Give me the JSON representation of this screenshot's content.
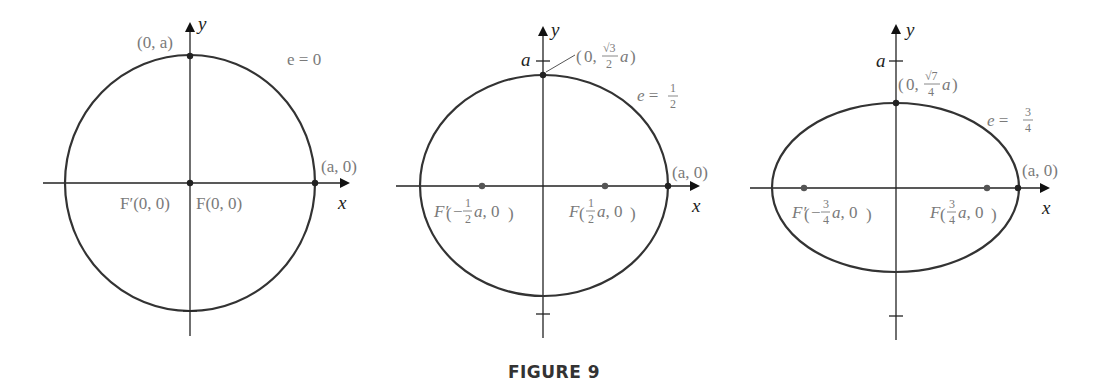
{
  "figure": {
    "caption": "FIGURE 9",
    "stroke_color": "#333333",
    "label_color": "#7a7a7a"
  },
  "panels": [
    {
      "eccentricity_label": "e = 0",
      "e": "0",
      "vertex_top": "(0, a)",
      "vertex_right": "(a, 0)",
      "focus_left": "F′(0, 0)",
      "focus_right": "F(0, 0)",
      "x_axis": "x",
      "y_axis": "y"
    },
    {
      "eccentricity_label": "e = 1/2",
      "e_num": "1",
      "e_den": "2",
      "vertex_top": "(0, √3/2 a)",
      "vertex_top_num": "√3",
      "vertex_top_den": "2",
      "vertex_right": "(a, 0)",
      "focus_left": "F′(−1/2 a, 0)",
      "focus_right": "F(1/2 a, 0)",
      "focus_num": "1",
      "focus_den": "2",
      "tick_label": "a",
      "x_axis": "x",
      "y_axis": "y"
    },
    {
      "eccentricity_label": "e = 3/4",
      "e_num": "3",
      "e_den": "4",
      "vertex_top": "(0, √7/4 a)",
      "vertex_top_num": "√7",
      "vertex_top_den": "4",
      "vertex_right": "(a, 0)",
      "focus_left": "F′(−3/4 a, 0)",
      "focus_right": "F(3/4 a, 0)",
      "focus_num": "3",
      "focus_den": "4",
      "tick_label": "a",
      "x_axis": "x",
      "y_axis": "y"
    }
  ]
}
